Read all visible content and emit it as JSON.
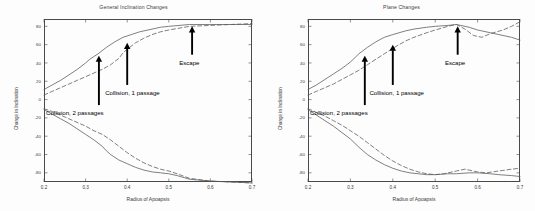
{
  "figure": {
    "background": "#ffffff",
    "axis_color": "#4a4a4a",
    "curve_color": "#555555",
    "annotation_color": "#000000"
  },
  "panels": [
    {
      "id": "general-inclination-changes",
      "title": "General Inclination Changes",
      "xlabel": "Radius of Apoapsis",
      "ylabel": "Change in Inclination",
      "xticks": [
        "0.2",
        "0.3",
        "0.4",
        "0.5",
        "0.6",
        "0.7"
      ],
      "yticks": [
        "80",
        "60",
        "40",
        "20",
        "0",
        "-20",
        "-40",
        "-60",
        "-80"
      ],
      "annotations": [
        {
          "label": "Collision, 2 passages",
          "arrow_x": 0.332,
          "arrow_y_tip": 48,
          "arrow_y_base": -6,
          "text_x": 0.205,
          "text_y": -14
        },
        {
          "label": "Collision, 1 passage",
          "arrow_x": 0.4,
          "arrow_y_tip": 62,
          "arrow_y_base": 16,
          "text_x": 0.347,
          "text_y": 8
        },
        {
          "label": "Escape",
          "arrow_x": 0.556,
          "arrow_y_tip": 80,
          "arrow_y_base": 49,
          "text_x": 0.525,
          "text_y": 41
        }
      ]
    },
    {
      "id": "plane-changes",
      "title": "Plane Changes",
      "xlabel": "Radius of Apoapsis",
      "ylabel": "Change in Inclination",
      "xticks": [
        "0.2",
        "0.3",
        "0.4",
        "0.5",
        "0.6",
        "0.7"
      ],
      "yticks": [
        "80",
        "60",
        "40",
        "20",
        "0",
        "-20",
        "-40",
        "-60",
        "-80"
      ],
      "annotations": [
        {
          "label": "Collision, 2 passages",
          "arrow_x": 0.334,
          "arrow_y_tip": 48,
          "arrow_y_base": -6,
          "text_x": 0.205,
          "text_y": -14
        },
        {
          "label": "Collision, 1 passage",
          "arrow_x": 0.4,
          "arrow_y_tip": 60,
          "arrow_y_base": 16,
          "text_x": 0.345,
          "text_y": 8
        },
        {
          "label": "Escape",
          "arrow_x": 0.553,
          "arrow_y_tip": 80,
          "arrow_y_base": 49,
          "text_x": 0.523,
          "text_y": 41
        }
      ]
    }
  ],
  "chart_data": [
    {
      "type": "line",
      "title": "General Inclination Changes",
      "xlabel": "Radius of Apoapsis",
      "ylabel": "Change in Inclination",
      "xlim": [
        0.2,
        0.7
      ],
      "ylim": [
        -90,
        88
      ],
      "xticks": [
        0.2,
        0.3,
        0.4,
        0.5,
        0.6,
        0.7
      ],
      "yticks": [
        80,
        60,
        40,
        20,
        0,
        -20,
        -40,
        -60,
        -80
      ],
      "grid": false,
      "legend": "none",
      "annotations": [
        "Collision, 2 passages",
        "Collision, 1 passage",
        "Escape"
      ],
      "series": [
        {
          "name": "upper-solid",
          "style": "solid",
          "x": [
            0.2,
            0.22,
            0.24,
            0.26,
            0.28,
            0.3,
            0.31,
            0.32,
            0.33,
            0.35,
            0.37,
            0.39,
            0.41,
            0.43,
            0.45,
            0.48,
            0.5,
            0.55,
            0.6,
            0.65,
            0.7
          ],
          "y": [
            11,
            16,
            21,
            27,
            33,
            40,
            44,
            47,
            50,
            57,
            63,
            68,
            71,
            74,
            76,
            79,
            80,
            82,
            82,
            82,
            82
          ]
        },
        {
          "name": "upper-dashed",
          "style": "dashed",
          "x": [
            0.2,
            0.22,
            0.24,
            0.26,
            0.28,
            0.3,
            0.32,
            0.34,
            0.36,
            0.38,
            0.39,
            0.4,
            0.42,
            0.44,
            0.46,
            0.48,
            0.5,
            0.55,
            0.6,
            0.65,
            0.7
          ],
          "y": [
            5,
            9,
            13,
            17,
            21,
            25,
            29,
            33,
            38,
            45,
            51,
            55,
            62,
            67,
            71,
            74,
            76,
            80,
            81,
            82,
            83
          ]
        },
        {
          "name": "lower-solid",
          "style": "solid",
          "x": [
            0.2,
            0.22,
            0.24,
            0.26,
            0.28,
            0.3,
            0.32,
            0.34,
            0.35,
            0.36,
            0.38,
            0.4,
            0.42,
            0.44,
            0.46,
            0.48,
            0.5,
            0.52,
            0.55,
            0.6,
            0.65,
            0.7
          ],
          "y": [
            -11,
            -16,
            -21,
            -26,
            -32,
            -38,
            -44,
            -51,
            -56,
            -60,
            -66,
            -70,
            -74,
            -77,
            -79,
            -80,
            -81,
            -83,
            -87,
            -89,
            -90,
            -91
          ]
        },
        {
          "name": "lower-dashed",
          "style": "dashed",
          "x": [
            0.2,
            0.22,
            0.24,
            0.26,
            0.28,
            0.3,
            0.32,
            0.34,
            0.36,
            0.38,
            0.4,
            0.42,
            0.44,
            0.46,
            0.48,
            0.5,
            0.52,
            0.55,
            0.6,
            0.65,
            0.7
          ],
          "y": [
            -10,
            -13,
            -17,
            -21,
            -25,
            -29,
            -34,
            -38,
            -44,
            -51,
            -58,
            -64,
            -69,
            -73,
            -76,
            -78,
            -81,
            -86,
            -89,
            -90,
            -91
          ]
        }
      ]
    },
    {
      "type": "line",
      "title": "Plane Changes",
      "xlabel": "Radius of Apoapsis",
      "ylabel": "Change in Inclination",
      "xlim": [
        0.2,
        0.7
      ],
      "ylim": [
        -90,
        88
      ],
      "xticks": [
        0.2,
        0.3,
        0.4,
        0.5,
        0.6,
        0.7
      ],
      "yticks": [
        80,
        60,
        40,
        20,
        0,
        -20,
        -40,
        -60,
        -80
      ],
      "grid": false,
      "legend": "none",
      "annotations": [
        "Collision, 2 passages",
        "Collision, 1 passage",
        "Escape"
      ],
      "series": [
        {
          "name": "upper-solid",
          "style": "solid",
          "x": [
            0.2,
            0.22,
            0.24,
            0.26,
            0.28,
            0.3,
            0.32,
            0.34,
            0.36,
            0.38,
            0.4,
            0.43,
            0.45,
            0.48,
            0.5,
            0.53,
            0.55,
            0.58,
            0.6,
            0.63,
            0.65,
            0.68,
            0.7
          ],
          "y": [
            11,
            16,
            22,
            28,
            34,
            41,
            50,
            57,
            63,
            68,
            71,
            75,
            77,
            79,
            80,
            81,
            82,
            79,
            76,
            73,
            71,
            68,
            65
          ]
        },
        {
          "name": "upper-dashed",
          "style": "dashed",
          "x": [
            0.2,
            0.22,
            0.24,
            0.26,
            0.28,
            0.3,
            0.32,
            0.34,
            0.36,
            0.38,
            0.4,
            0.43,
            0.45,
            0.48,
            0.5,
            0.53,
            0.55,
            0.57,
            0.59,
            0.61,
            0.63,
            0.66,
            0.68,
            0.7
          ],
          "y": [
            5,
            9,
            13,
            17,
            22,
            27,
            32,
            38,
            44,
            50,
            56,
            64,
            68,
            73,
            76,
            80,
            82,
            77,
            70,
            68,
            72,
            76,
            80,
            85
          ]
        },
        {
          "name": "lower-solid",
          "style": "solid",
          "x": [
            0.2,
            0.22,
            0.24,
            0.26,
            0.28,
            0.3,
            0.32,
            0.34,
            0.36,
            0.38,
            0.4,
            0.42,
            0.44,
            0.46,
            0.48,
            0.5,
            0.53,
            0.55,
            0.58,
            0.6,
            0.63,
            0.65,
            0.68,
            0.7
          ],
          "y": [
            -11,
            -17,
            -23,
            -29,
            -36,
            -43,
            -52,
            -60,
            -66,
            -71,
            -75,
            -78,
            -80,
            -81,
            -82,
            -82,
            -81,
            -81,
            -80,
            -80,
            -81,
            -82,
            -83,
            -84
          ]
        },
        {
          "name": "lower-dashed",
          "style": "dashed",
          "x": [
            0.2,
            0.22,
            0.24,
            0.26,
            0.28,
            0.3,
            0.32,
            0.34,
            0.36,
            0.38,
            0.4,
            0.42,
            0.44,
            0.46,
            0.48,
            0.5,
            0.52,
            0.55,
            0.57,
            0.6,
            0.62,
            0.65,
            0.68,
            0.7
          ],
          "y": [
            -10,
            -14,
            -18,
            -23,
            -28,
            -34,
            -40,
            -47,
            -54,
            -61,
            -67,
            -72,
            -76,
            -79,
            -81,
            -82,
            -81,
            -78,
            -76,
            -79,
            -80,
            -78,
            -76,
            -75
          ]
        }
      ]
    }
  ]
}
